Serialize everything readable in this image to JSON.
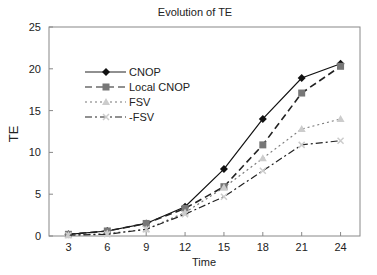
{
  "chart_data": {
    "type": "line",
    "title": "Evolution of TE",
    "xlabel": "Time",
    "ylabel": "TE",
    "x": [
      3,
      6,
      9,
      12,
      15,
      18,
      21,
      24
    ],
    "xticks": [
      "3",
      "6",
      "9",
      "12",
      "15",
      "18",
      "21",
      "24"
    ],
    "yticks": [
      "0",
      "5",
      "10",
      "15",
      "20",
      "25"
    ],
    "ylim": [
      0,
      25
    ],
    "xlim": [
      1.5,
      25.5
    ],
    "grid": false,
    "legend_position": "upper-left",
    "series": [
      {
        "name": "CNOP",
        "style": "solid",
        "marker": "diamond",
        "color": "#111111",
        "values": [
          0.2,
          0.6,
          1.5,
          3.5,
          8.0,
          14.0,
          18.9,
          20.6
        ]
      },
      {
        "name": "Local CNOP",
        "style": "dashed",
        "marker": "square",
        "color": "#777777",
        "values": [
          0.2,
          0.6,
          1.5,
          3.3,
          5.9,
          10.9,
          17.1,
          20.3
        ]
      },
      {
        "name": "FSV",
        "style": "dotted",
        "marker": "triangle",
        "color": "#cccccc",
        "values": [
          0.1,
          0.3,
          0.8,
          2.8,
          5.8,
          9.3,
          12.8,
          14.0
        ]
      },
      {
        "name": "-FSV",
        "style": "dashdot",
        "marker": "x",
        "color": "#222222",
        "values": [
          0.1,
          0.2,
          0.8,
          2.6,
          4.7,
          7.8,
          10.9,
          11.4
        ]
      }
    ]
  }
}
